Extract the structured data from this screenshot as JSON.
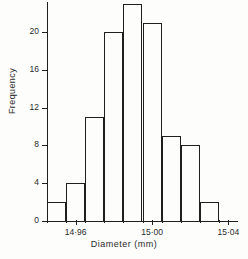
{
  "chart_data": {
    "type": "bar",
    "title": "",
    "xlabel": "Diameter (mm)",
    "ylabel": "Frequency",
    "grid": false,
    "legend": null,
    "categories": [
      "14.95",
      "14.96",
      "14.97",
      "14.98",
      "14.99",
      "15.00",
      "15.01",
      "15.02",
      "15.03"
    ],
    "values": [
      2,
      4,
      11,
      20,
      23,
      21,
      9,
      8,
      2
    ],
    "ylim": [
      0,
      23
    ],
    "xlim": [
      14.945,
      15.045
    ],
    "yticks": [
      0,
      4,
      8,
      12,
      16,
      20
    ],
    "ytick_labels": [
      "0",
      "4",
      "8",
      "12",
      "16",
      "20"
    ],
    "xticks": [
      14.96,
      15.0,
      15.04
    ],
    "xtick_labels": [
      "14·96",
      "15·00",
      "15·04"
    ],
    "bin_width": 0.01,
    "bin_edges": [
      14.945,
      14.955,
      14.965,
      14.975,
      14.985,
      14.995,
      15.005,
      15.015,
      15.025,
      15.035
    ]
  },
  "axes": {
    "y_title": "Frequency",
    "x_title": "Diameter (mm)"
  },
  "colors": {
    "line": "#1f1f1f",
    "background": "#fdfdfc",
    "text": "#2a2a2a"
  }
}
